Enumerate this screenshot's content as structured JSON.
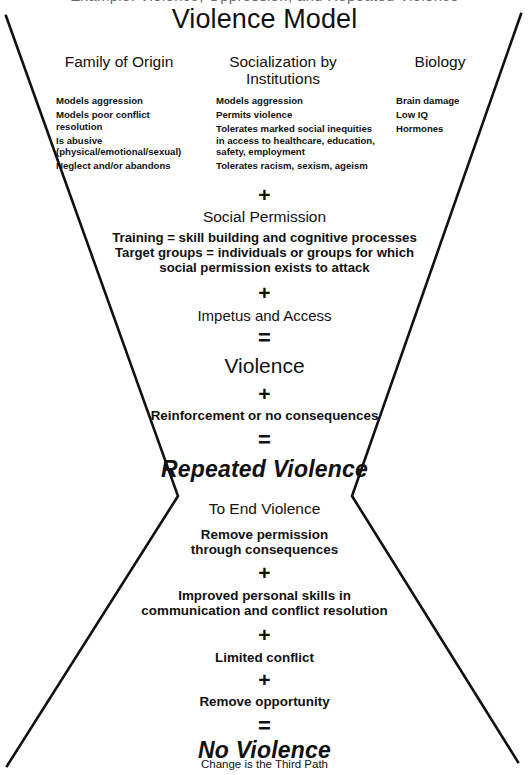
{
  "page": {
    "top_partial_text": "Example: Violence, Oppression, and Repeated Violence",
    "title": "Violence Model",
    "bottom_caption": "Change is the Third Path",
    "line_color": "#111111"
  },
  "operators": {
    "plus": "+",
    "equals": "="
  },
  "columns": [
    {
      "heading": "Family of Origin",
      "items": [
        "Models aggression",
        "Models poor conflict\nresolution",
        "Is abusive\n(physical/emotional/sexual)",
        "Neglect and/or abandons"
      ]
    },
    {
      "heading": "Socialization by\nInstitutions",
      "items": [
        "Models aggression",
        "Permits violence",
        "Tolerates marked social inequities\nin access to healthcare, education,\nsafety, employment",
        "Tolerates racism, sexism, ageism"
      ]
    },
    {
      "heading": "Biology",
      "items": [
        "Brain damage",
        "Low IQ",
        "Hormones"
      ]
    }
  ],
  "upper_flow": {
    "op1": "+",
    "social_permission_heading": "Social Permission",
    "social_permission_body_line1": "Training = skill building and cognitive processes",
    "social_permission_body_line2": "Target groups = individuals or groups for which",
    "social_permission_body_line3": "social permission exists to attack",
    "op2": "+",
    "impetus": "Impetus and Access",
    "op3": "=",
    "violence": "Violence",
    "op4": "+",
    "reinforcement": "Reinforcement or no consequences",
    "op5": "=",
    "repeated_violence": "Repeated Violence"
  },
  "lower_flow": {
    "heading": "To End Violence",
    "remove_permission_line1": "Remove permission",
    "remove_permission_line2": "through consequences",
    "op1": "+",
    "improved_skills_line1": "Improved personal skills in",
    "improved_skills_line2": "communication and conflict resolution",
    "op2": "+",
    "limited_conflict": "Limited conflict",
    "op3": "+",
    "remove_opportunity": "Remove opportunity",
    "op4": "=",
    "no_violence": "No Violence"
  }
}
